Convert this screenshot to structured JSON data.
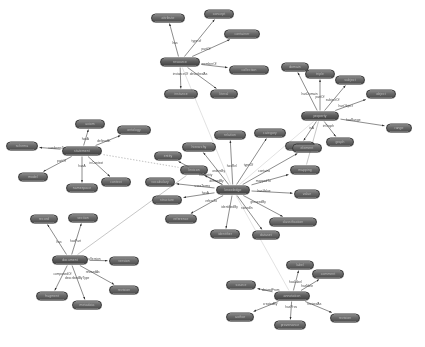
{
  "figure": {
    "kind": "node-link-graph",
    "title": "",
    "background": "#ffffff",
    "width": 425,
    "height": 347,
    "node_fill": "#5f5f5f",
    "node_text_color": "#e9e9e9",
    "edge_color": "#3c3c3c",
    "edge_label_color": "#2a2a2a",
    "legibility_note": "node and edge captions are rendered below the legible resolution of the source image"
  },
  "chart_data": {
    "type": "diagram",
    "layout": "six hub-and-spoke clusters joined by long inter-cluster edges",
    "cluster_count": 6,
    "node_count": 62,
    "edge_count": 61,
    "hubs": [
      {
        "id": "hub-top",
        "x": 180,
        "y": 62,
        "spokes": 7
      },
      {
        "id": "hub-right",
        "x": 320,
        "y": 116,
        "spokes": 8
      },
      {
        "id": "hub-left",
        "x": 82,
        "y": 151,
        "spokes": 7
      },
      {
        "id": "hub-center",
        "x": 233,
        "y": 190,
        "spokes": 15
      },
      {
        "id": "hub-bottom-left",
        "x": 70,
        "y": 260,
        "spokes": 6
      },
      {
        "id": "hub-bottom-right",
        "x": 292,
        "y": 296,
        "spokes": 7
      }
    ]
  },
  "nodes": [
    {
      "id": "n00",
      "x": 180,
      "y": 62,
      "w": 40,
      "hub": true,
      "label": "resource"
    },
    {
      "id": "n01",
      "x": 168,
      "y": 18,
      "w": 34,
      "label": "attribute"
    },
    {
      "id": "n02",
      "x": 219,
      "y": 14,
      "w": 30,
      "label": "concept"
    },
    {
      "id": "n03",
      "x": 242,
      "y": 34,
      "w": 36,
      "label": "container"
    },
    {
      "id": "n04",
      "x": 249,
      "y": 70,
      "w": 40,
      "label": "collection"
    },
    {
      "id": "n05",
      "x": 181,
      "y": 94,
      "w": 34,
      "label": "instance"
    },
    {
      "id": "n06",
      "x": 224,
      "y": 94,
      "w": 28,
      "label": "literal"
    },
    {
      "id": "n10",
      "x": 320,
      "y": 116,
      "w": 38,
      "hub": true,
      "label": "property"
    },
    {
      "id": "n11",
      "x": 295,
      "y": 67,
      "w": 28,
      "label": "domain"
    },
    {
      "id": "n12",
      "x": 320,
      "y": 74,
      "w": 30,
      "label": "triple"
    },
    {
      "id": "n13",
      "x": 350,
      "y": 80,
      "w": 30,
      "label": "subject"
    },
    {
      "id": "n14",
      "x": 381,
      "y": 94,
      "w": 30,
      "label": "object"
    },
    {
      "id": "n15",
      "x": 399,
      "y": 128,
      "w": 26,
      "label": "range"
    },
    {
      "id": "n16",
      "x": 340,
      "y": 142,
      "w": 28,
      "label": "graph"
    },
    {
      "id": "n17",
      "x": 300,
      "y": 146,
      "w": 30,
      "label": "predicate"
    },
    {
      "id": "n20",
      "x": 82,
      "y": 151,
      "w": 40,
      "hub": true,
      "label": "statement"
    },
    {
      "id": "n21",
      "x": 90,
      "y": 124,
      "w": 30,
      "label": "axiom"
    },
    {
      "id": "n22",
      "x": 134,
      "y": 130,
      "w": 34,
      "label": "ontology"
    },
    {
      "id": "n23",
      "x": 22,
      "y": 146,
      "w": 32,
      "label": "schema"
    },
    {
      "id": "n24",
      "x": 33,
      "y": 177,
      "w": 30,
      "label": "model"
    },
    {
      "id": "n25",
      "x": 82,
      "y": 188,
      "w": 32,
      "label": "namespace"
    },
    {
      "id": "n26",
      "x": 116,
      "y": 182,
      "w": 30,
      "label": "context"
    },
    {
      "id": "n30",
      "x": 233,
      "y": 190,
      "w": 34,
      "hub": true,
      "label": "knowledge"
    },
    {
      "id": "n31",
      "x": 230,
      "y": 135,
      "w": 32,
      "label": "relation"
    },
    {
      "id": "n32",
      "x": 270,
      "y": 133,
      "w": 32,
      "label": "category"
    },
    {
      "id": "n33",
      "x": 199,
      "y": 147,
      "w": 34,
      "label": "hierarchy"
    },
    {
      "id": "n34",
      "x": 307,
      "y": 148,
      "w": 30,
      "label": "element"
    },
    {
      "id": "n35",
      "x": 168,
      "y": 156,
      "w": 28,
      "label": "entity"
    },
    {
      "id": "n36",
      "x": 305,
      "y": 170,
      "w": 30,
      "label": "mapping"
    },
    {
      "id": "n37",
      "x": 160,
      "y": 182,
      "w": 30,
      "label": "vocabulary"
    },
    {
      "id": "n38",
      "x": 307,
      "y": 194,
      "w": 26,
      "label": "value"
    },
    {
      "id": "n39",
      "x": 167,
      "y": 200,
      "w": 30,
      "label": "structure"
    },
    {
      "id": "n40",
      "x": 293,
      "y": 222,
      "w": 48,
      "label": "classification"
    },
    {
      "id": "n41",
      "x": 181,
      "y": 219,
      "w": 32,
      "label": "reference"
    },
    {
      "id": "n42",
      "x": 225,
      "y": 234,
      "w": 30,
      "label": "identifier"
    },
    {
      "id": "n43",
      "x": 266,
      "y": 235,
      "w": 28,
      "label": "dataset"
    },
    {
      "id": "n44",
      "x": 194,
      "y": 170,
      "w": 28,
      "label": "lexicon"
    },
    {
      "id": "n50",
      "x": 70,
      "y": 260,
      "w": 36,
      "hub": true,
      "label": "document"
    },
    {
      "id": "n51",
      "x": 44,
      "y": 219,
      "w": 28,
      "label": "record"
    },
    {
      "id": "n52",
      "x": 83,
      "y": 218,
      "w": 30,
      "label": "section"
    },
    {
      "id": "n53",
      "x": 124,
      "y": 261,
      "w": 30,
      "label": "version"
    },
    {
      "id": "n54",
      "x": 124,
      "y": 290,
      "w": 30,
      "label": "revision"
    },
    {
      "id": "n55",
      "x": 52,
      "y": 296,
      "w": 32,
      "label": "fragment"
    },
    {
      "id": "n56",
      "x": 87,
      "y": 305,
      "w": 30,
      "label": "metadata"
    },
    {
      "id": "n60",
      "x": 292,
      "y": 296,
      "w": 36,
      "hub": true,
      "label": "annotation"
    },
    {
      "id": "n61",
      "x": 300,
      "y": 265,
      "w": 28,
      "label": "label"
    },
    {
      "id": "n62",
      "x": 328,
      "y": 274,
      "w": 32,
      "label": "comment"
    },
    {
      "id": "n63",
      "x": 241,
      "y": 285,
      "w": 30,
      "label": "source"
    },
    {
      "id": "n64",
      "x": 240,
      "y": 317,
      "w": 28,
      "label": "author"
    },
    {
      "id": "n65",
      "x": 290,
      "y": 325,
      "w": 32,
      "label": "provenance"
    },
    {
      "id": "n66",
      "x": 345,
      "y": 318,
      "w": 30,
      "label": "revision"
    }
  ],
  "edges": [
    {
      "from": "n00",
      "to": "n01",
      "label": "has"
    },
    {
      "from": "n00",
      "to": "n02",
      "label": "type of"
    },
    {
      "from": "n00",
      "to": "n03",
      "label": "partOf"
    },
    {
      "from": "n00",
      "to": "n04",
      "label": "memberOf"
    },
    {
      "from": "n00",
      "to": "n05",
      "label": "instanceOf"
    },
    {
      "from": "n00",
      "to": "n06",
      "label": "describedAs"
    },
    {
      "from": "n10",
      "to": "n11",
      "label": "hasDomain"
    },
    {
      "from": "n10",
      "to": "n12",
      "label": "partOf"
    },
    {
      "from": "n10",
      "to": "n13",
      "label": "subjectOf"
    },
    {
      "from": "n10",
      "to": "n14",
      "label": "hasObject"
    },
    {
      "from": "n10",
      "to": "n15",
      "label": "hasRange"
    },
    {
      "from": "n10",
      "to": "n16",
      "label": "inGraph"
    },
    {
      "from": "n10",
      "to": "n17",
      "label": "isA"
    },
    {
      "from": "n20",
      "to": "n21",
      "label": "hasA"
    },
    {
      "from": "n20",
      "to": "n22",
      "label": "definedIn"
    },
    {
      "from": "n20",
      "to": "n23",
      "label": "conformsTo"
    },
    {
      "from": "n20",
      "to": "n24",
      "label": "partOf"
    },
    {
      "from": "n20",
      "to": "n25",
      "label": "hasA"
    },
    {
      "from": "n20",
      "to": "n26",
      "label": "inContext"
    },
    {
      "from": "n30",
      "to": "n31",
      "label": "hasRel"
    },
    {
      "from": "n30",
      "to": "n32",
      "label": "typeOf"
    },
    {
      "from": "n30",
      "to": "n33",
      "label": "ordersBy"
    },
    {
      "from": "n30",
      "to": "n34",
      "label": "contains"
    },
    {
      "from": "n30",
      "to": "n35",
      "label": "hasEntity"
    },
    {
      "from": "n30",
      "to": "n36",
      "label": "mappedTo"
    },
    {
      "from": "n30",
      "to": "n37",
      "label": "usesTerms"
    },
    {
      "from": "n30",
      "to": "n38",
      "label": "hasValue"
    },
    {
      "from": "n30",
      "to": "n39",
      "label": "hasA"
    },
    {
      "from": "n30",
      "to": "n40",
      "label": "groupedBy"
    },
    {
      "from": "n30",
      "to": "n41",
      "label": "refersTo"
    },
    {
      "from": "n30",
      "to": "n42",
      "label": "identifiedBy"
    },
    {
      "from": "n30",
      "to": "n43",
      "label": "storedIn"
    },
    {
      "from": "n30",
      "to": "n44",
      "label": "definedBy"
    },
    {
      "from": "n50",
      "to": "n51",
      "label": "has"
    },
    {
      "from": "n50",
      "to": "n52",
      "label": "hasPart"
    },
    {
      "from": "n50",
      "to": "n53",
      "label": "hasVersion"
    },
    {
      "from": "n50",
      "to": "n54",
      "label": "revisedAs"
    },
    {
      "from": "n50",
      "to": "n55",
      "label": "composedOf"
    },
    {
      "from": "n50",
      "to": "n56",
      "label": "describedByType"
    },
    {
      "from": "n60",
      "to": "n61",
      "label": "hasLabel"
    },
    {
      "from": "n60",
      "to": "n62",
      "label": "hasNote"
    },
    {
      "from": "n60",
      "to": "n63",
      "label": "derivedFrom"
    },
    {
      "from": "n60",
      "to": "n64",
      "label": "createdBy"
    },
    {
      "from": "n60",
      "to": "n65",
      "label": "hasProv"
    },
    {
      "from": "n60",
      "to": "n66",
      "label": "revisedAs"
    },
    {
      "from": "n00",
      "to": "n30",
      "label": "",
      "style": "faint"
    },
    {
      "from": "n10",
      "to": "n30",
      "label": "",
      "style": "faint"
    },
    {
      "from": "n20",
      "to": "n44",
      "label": "",
      "style": "dotted"
    },
    {
      "from": "n30",
      "to": "n60",
      "label": "",
      "style": "faint"
    },
    {
      "from": "n50",
      "to": "n44",
      "label": "",
      "style": "thin"
    },
    {
      "from": "n10",
      "to": "n36",
      "label": "",
      "style": "thin"
    }
  ]
}
